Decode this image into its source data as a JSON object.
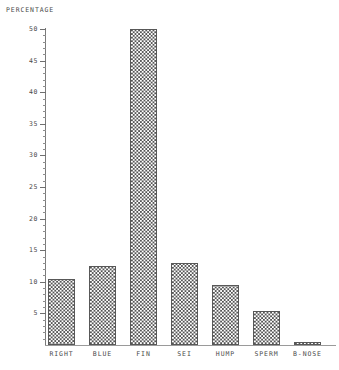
{
  "chart_data": {
    "type": "bar",
    "title": "PERCENTAGE",
    "xlabel": "",
    "ylabel": "PERCENTAGE",
    "categories": [
      "RIGHT",
      "BLUE",
      "FIN",
      "SEI",
      "HUMP",
      "SPERM",
      "B-NOSE"
    ],
    "values": [
      10.4,
      12.5,
      50.0,
      13.0,
      9.5,
      5.4,
      0.5
    ],
    "ylim": [
      0,
      50
    ],
    "ytick_labels": [
      "50",
      "45",
      "40",
      "35",
      "30",
      "25",
      "20",
      "15",
      "10",
      "5"
    ],
    "ytick_values": [
      50,
      45,
      40,
      35,
      30,
      25,
      20,
      15,
      10,
      5
    ],
    "minor_tick_interval": 1,
    "grid": false,
    "legend": null,
    "bar_fill": "checkerboard-hatch",
    "colors": {
      "axis": "#7a7a7a",
      "text": "#4a4a4a",
      "bar_edge": "#585858",
      "bar_pattern": "#555555",
      "background": "#ffffff"
    }
  }
}
